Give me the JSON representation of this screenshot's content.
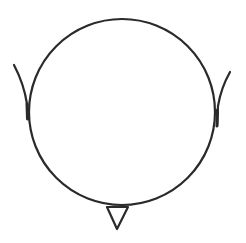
{
  "diagram": {
    "type": "head-schematic-top-view",
    "stroke_color": "#2a2a2a",
    "background": "#ffffff",
    "parts": [
      {
        "name": "head",
        "shape": "circle",
        "cx": 122,
        "cy": 112,
        "r": 93
      },
      {
        "name": "left-ear",
        "shape": "curve"
      },
      {
        "name": "right-ear",
        "shape": "curve"
      },
      {
        "name": "nose",
        "shape": "triangle",
        "points": [
          [
            107,
            207
          ],
          [
            128,
            207
          ],
          [
            117,
            229
          ]
        ]
      }
    ]
  }
}
